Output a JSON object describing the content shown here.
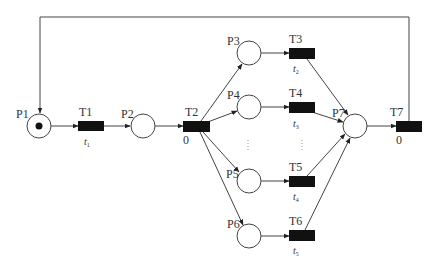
{
  "diagram": {
    "type": "petri-net",
    "colors": {
      "arc": "#444444",
      "transition_fill": "#111111",
      "place_fill": "#ffffff",
      "token": "#111111",
      "text": "#333333"
    },
    "places": [
      {
        "id": "P1",
        "label": "P1",
        "cx": 39,
        "cy": 126,
        "tokens": 1
      },
      {
        "id": "P2",
        "label": "P2",
        "cx": 143,
        "cy": 126,
        "tokens": 0
      },
      {
        "id": "P3",
        "label": "P3",
        "cx": 249,
        "cy": 53,
        "tokens": 0
      },
      {
        "id": "P4",
        "label": "P4",
        "cx": 249,
        "cy": 107,
        "tokens": 0
      },
      {
        "id": "P5",
        "label": "P5",
        "cx": 249,
        "cy": 181,
        "tokens": 0
      },
      {
        "id": "P6",
        "label": "P6",
        "cx": 249,
        "cy": 236,
        "tokens": 0
      },
      {
        "id": "P7",
        "label": "P7",
        "cx": 355,
        "cy": 126,
        "tokens": 0
      }
    ],
    "transitions": [
      {
        "id": "T1",
        "label": "T1",
        "x": 78,
        "y": 121,
        "time": "t",
        "time_sub": "1"
      },
      {
        "id": "T2",
        "label": "T2",
        "x": 183,
        "y": 121,
        "time": "0",
        "time_sub": ""
      },
      {
        "id": "T3",
        "label": "T3",
        "x": 289,
        "y": 48,
        "time": "t",
        "time_sub": "2"
      },
      {
        "id": "T4",
        "label": "T4",
        "x": 289,
        "y": 102,
        "time": "t",
        "time_sub": "3"
      },
      {
        "id": "T5",
        "label": "T5",
        "x": 289,
        "y": 176,
        "time": "t",
        "time_sub": "4"
      },
      {
        "id": "T6",
        "label": "T6",
        "x": 289,
        "y": 230,
        "time": "t",
        "time_sub": "5"
      },
      {
        "id": "T7",
        "label": "T7",
        "x": 396,
        "y": 121,
        "time": "0",
        "time_sub": ""
      }
    ],
    "arcs": [
      {
        "from": "P1",
        "to": "T1"
      },
      {
        "from": "T1",
        "to": "P2"
      },
      {
        "from": "P2",
        "to": "T2"
      },
      {
        "from": "T2",
        "to": "P3"
      },
      {
        "from": "T2",
        "to": "P4"
      },
      {
        "from": "T2",
        "to": "P5"
      },
      {
        "from": "T2",
        "to": "P6"
      },
      {
        "from": "P3",
        "to": "T3"
      },
      {
        "from": "P4",
        "to": "T4"
      },
      {
        "from": "P5",
        "to": "T5"
      },
      {
        "from": "P6",
        "to": "T6"
      },
      {
        "from": "T3",
        "to": "P7"
      },
      {
        "from": "T4",
        "to": "P7"
      },
      {
        "from": "T5",
        "to": "P7"
      },
      {
        "from": "T6",
        "to": "P7"
      },
      {
        "from": "P7",
        "to": "T7"
      },
      {
        "from": "T7",
        "to": "P1",
        "routing": "feedback-over-top"
      }
    ],
    "ellipsis_marks": [
      "⋮",
      "⋮"
    ]
  }
}
